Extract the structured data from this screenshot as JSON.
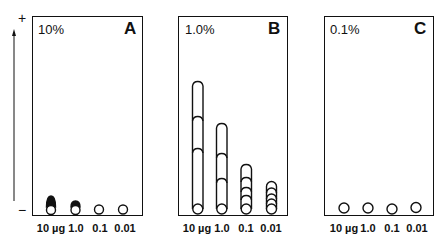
{
  "figure": {
    "axis": {
      "plus_label": "+",
      "minus_label": "−",
      "direction": "upward migration toward anode (+)"
    },
    "lane_labels": [
      "10 µg",
      "1.0",
      "0.1",
      "0.01"
    ],
    "panels": [
      {
        "letter": "A",
        "concentration": "10%",
        "lanes": [
          {
            "amount": "10 µg",
            "pattern": "origin spot with short dark tail"
          },
          {
            "amount": "1.0",
            "pattern": "origin spot with small dark cap"
          },
          {
            "amount": "0.1",
            "pattern": "origin spot only"
          },
          {
            "amount": "0.01",
            "pattern": "origin spot only"
          }
        ]
      },
      {
        "letter": "B",
        "concentration": "1.0%",
        "lanes": [
          {
            "amount": "10 µg",
            "pattern": "long streak with 3 bands"
          },
          {
            "amount": "1.0",
            "pattern": "medium streak with 3 bands"
          },
          {
            "amount": "0.1",
            "pattern": "short streak with 4 bands"
          },
          {
            "amount": "0.01",
            "pattern": "short streak with 4 bands"
          }
        ]
      },
      {
        "letter": "C",
        "concentration": "0.1%",
        "lanes": [
          {
            "amount": "10 µg",
            "pattern": "origin spot only"
          },
          {
            "amount": "1.0",
            "pattern": "origin spot only"
          },
          {
            "amount": "0.1",
            "pattern": "origin spot only"
          },
          {
            "amount": "0.01",
            "pattern": "origin spot only"
          }
        ]
      }
    ],
    "colors": {
      "ink": "#111111",
      "background": "#ffffff"
    }
  }
}
